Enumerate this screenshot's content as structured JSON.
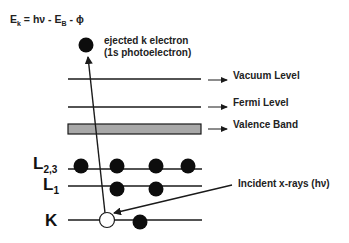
{
  "equation": {
    "lhs": "E",
    "lhs_sub": "k",
    "rhs_part1": " = hν - E",
    "rhs_sub": "B",
    "rhs_part2": " - ϕ"
  },
  "ejected_label": {
    "line1": "ejected k electron",
    "line2": "(1s photoelectron)"
  },
  "levels": [
    {
      "label": "Vacuum Level"
    },
    {
      "label": "Fermi Level"
    },
    {
      "label": "Valence Band"
    }
  ],
  "shells": [
    {
      "main": "L",
      "sub": "2,3",
      "electrons": 4
    },
    {
      "main": "L",
      "sub": "1",
      "electrons": 2
    },
    {
      "main": "K",
      "sub": "",
      "electrons": 1,
      "vacancies": 1
    }
  ],
  "incident_label": "Incident x-rays (hν)",
  "colors": {
    "line": "#1a1a1a",
    "electron": "#0d0d0d",
    "valence_fill": "#a8a8a8"
  }
}
